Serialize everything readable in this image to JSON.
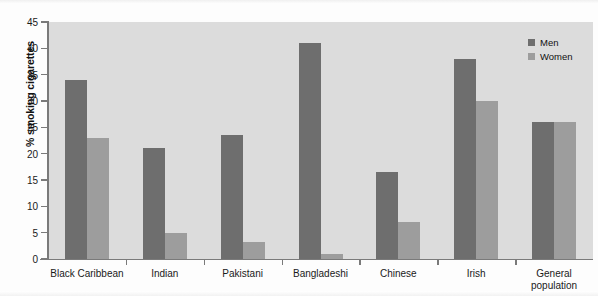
{
  "chart_data": {
    "type": "bar",
    "title": "",
    "xlabel": "",
    "ylabel": "% smoking cigarettes",
    "ylim": [
      0,
      45
    ],
    "ytick_step": 5,
    "yticks": [
      0,
      5,
      10,
      15,
      20,
      25,
      30,
      35,
      40,
      45
    ],
    "ytick_labels": [
      "0",
      "5",
      "10",
      "15",
      "20",
      "25",
      "30",
      "35",
      "40",
      "45"
    ],
    "grid": false,
    "legend_position": "top-right",
    "categories": [
      "Black Caribbean",
      "Indian",
      "Pakistani",
      "Bangladeshi",
      "Chinese",
      "Irish",
      "General\npopulation"
    ],
    "series": [
      {
        "name": "Men",
        "color": "#6e6e6e",
        "values": [
          34,
          21,
          23.5,
          41,
          16.5,
          38,
          26
        ]
      },
      {
        "name": "Women",
        "color": "#9d9d9d",
        "values": [
          23,
          5,
          3.3,
          1,
          7,
          30,
          26
        ]
      }
    ]
  },
  "legend": {
    "items": [
      {
        "label": "Men",
        "color": "#6e6e6e"
      },
      {
        "label": "Women",
        "color": "#9d9d9d"
      }
    ]
  },
  "colors": {
    "plot_background": "#dcdcdc",
    "axis": "#7a7a7a",
    "men": "#6e6e6e",
    "women": "#9d9d9d",
    "text": "#1a1a1a"
  }
}
